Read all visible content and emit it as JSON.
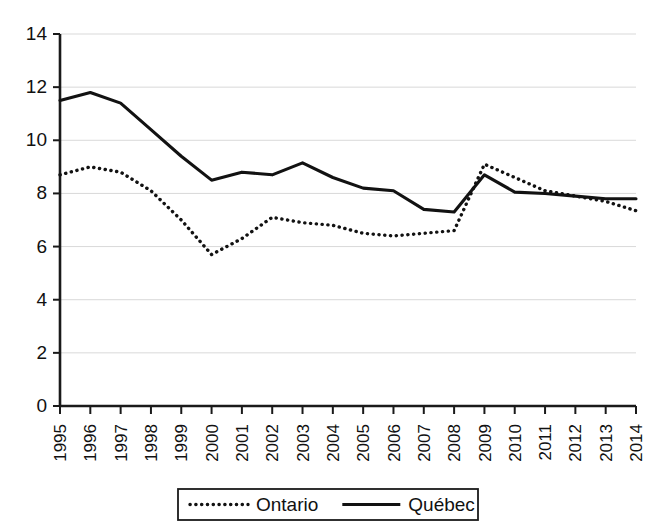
{
  "chart_data": {
    "type": "line",
    "title": "",
    "xlabel": "",
    "ylabel": "",
    "ylim": [
      0,
      14
    ],
    "ytick_step": 2,
    "yticks": [
      "0",
      "2",
      "4",
      "6",
      "8",
      "10",
      "12",
      "14"
    ],
    "grid": true,
    "legend_position": "bottom",
    "categories": [
      "1995",
      "1996",
      "1997",
      "1998",
      "1999",
      "2000",
      "2001",
      "2002",
      "2003",
      "2004",
      "2005",
      "2006",
      "2007",
      "2008",
      "2009",
      "2010",
      "2011",
      "2012",
      "2013",
      "2014"
    ],
    "series": [
      {
        "name": "Ontario",
        "style": "dotted",
        "color": "#121212",
        "values": [
          8.7,
          9.0,
          8.8,
          8.1,
          7.0,
          5.7,
          6.3,
          7.1,
          6.9,
          6.8,
          6.5,
          6.4,
          6.5,
          6.6,
          9.1,
          8.6,
          8.1,
          7.9,
          7.7,
          7.35
        ]
      },
      {
        "name": "Québec",
        "style": "solid",
        "color": "#121212",
        "values": [
          11.5,
          11.8,
          11.4,
          10.4,
          9.4,
          8.5,
          8.8,
          8.7,
          9.15,
          8.6,
          8.2,
          8.1,
          7.4,
          7.3,
          8.7,
          8.05,
          8.0,
          7.9,
          7.8,
          7.8
        ]
      }
    ],
    "legend": [
      {
        "label": "Ontario",
        "style": "dotted"
      },
      {
        "label": "Québec",
        "style": "solid"
      }
    ]
  }
}
